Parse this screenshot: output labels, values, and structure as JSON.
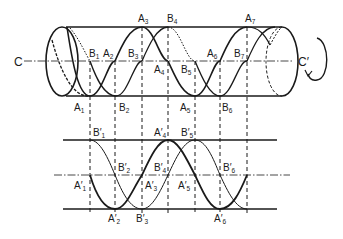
{
  "diagram": {
    "type": "helix-projection",
    "axis_labels": {
      "left": "C",
      "right": "C′"
    },
    "rotation_arrow": "counter-rotation-arrow",
    "colors": {
      "stroke": "#1a1a1a",
      "background": "#ffffff"
    },
    "cylinder_points": {
      "top": [
        {
          "name": "A",
          "sub": "3",
          "x": 142
        },
        {
          "name": "B",
          "sub": "4",
          "x": 170
        },
        {
          "name": "A",
          "sub": "7",
          "x": 247
        }
      ],
      "axis": [
        {
          "name": "B",
          "sub": "1",
          "x": 90
        },
        {
          "name": "A",
          "sub": "2",
          "x": 112
        },
        {
          "name": "B",
          "sub": "3",
          "x": 138
        },
        {
          "name": "A",
          "sub": "4",
          "x": 160
        },
        {
          "name": "B",
          "sub": "5",
          "x": 182
        },
        {
          "name": "A",
          "sub": "6",
          "x": 208
        },
        {
          "name": "B",
          "sub": "7",
          "x": 235
        }
      ],
      "bottom": [
        {
          "name": "A",
          "sub": "1",
          "x": 80
        },
        {
          "name": "B",
          "sub": "2",
          "x": 121
        },
        {
          "name": "A",
          "sub": "5",
          "x": 183
        },
        {
          "name": "B",
          "sub": "6",
          "x": 224
        }
      ]
    },
    "projection_points": {
      "top": [
        {
          "name": "B′",
          "sub": "1",
          "x": 93
        },
        {
          "name": "A′",
          "sub": "4",
          "x": 159
        },
        {
          "name": "B′",
          "sub": "5",
          "x": 183
        }
      ],
      "mid": [
        {
          "name": "B′",
          "sub": "2",
          "x": 117
        },
        {
          "name": "A′",
          "sub": "1",
          "x": 74
        },
        {
          "name": "B′",
          "sub": "4",
          "x": 156
        },
        {
          "name": "A′",
          "sub": "3",
          "x": 146
        },
        {
          "name": "A′",
          "sub": "5",
          "x": 179
        },
        {
          "name": "B′",
          "sub": "6",
          "x": 223
        }
      ],
      "bottom": [
        {
          "name": "A′",
          "sub": "2",
          "x": 108
        },
        {
          "name": "B′",
          "sub": "3",
          "x": 136
        },
        {
          "name": "A′",
          "sub": "6",
          "x": 215
        }
      ]
    }
  },
  "labels": {
    "C": "C",
    "Cprime": "C′",
    "A1": "A",
    "A1s": "1",
    "A2": "A",
    "A2s": "2",
    "A3": "A",
    "A3s": "3",
    "A4": "A",
    "A4s": "4",
    "A5": "A",
    "A5s": "5",
    "A6": "A",
    "A6s": "6",
    "A7": "A",
    "A7s": "7",
    "B1": "B",
    "B1s": "1",
    "B2": "B",
    "B2s": "2",
    "B3": "B",
    "B3s": "3",
    "B4": "B",
    "B4s": "4",
    "B5": "B",
    "B5s": "5",
    "B6": "B",
    "B6s": "6",
    "B7": "B",
    "B7s": "7",
    "A1p": "A′",
    "A2p": "A′",
    "A3p": "A′",
    "A4p": "A′",
    "A5p": "A′",
    "A6p": "A′",
    "B1p": "B′",
    "B2p": "B′",
    "B3p": "B′",
    "B4p": "B′",
    "B5p": "B′",
    "B6p": "B′"
  }
}
